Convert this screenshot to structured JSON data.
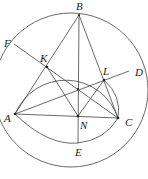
{
  "diagram": {
    "type": "geometry",
    "points": {
      "A": {
        "label": "A",
        "x": 15,
        "y": 114
      },
      "B": {
        "label": "B",
        "x": 79,
        "y": 15
      },
      "C": {
        "label": "C",
        "x": 118,
        "y": 118
      },
      "K": {
        "label": "K",
        "x": 47,
        "y": 67
      },
      "L": {
        "label": "L",
        "x": 104,
        "y": 80
      },
      "N": {
        "label": "N",
        "x": 78,
        "y": 116
      },
      "F": {
        "label": "F",
        "x": 14,
        "y": 44
      },
      "D": {
        "label": "D",
        "x": 129,
        "y": 71
      },
      "E": {
        "label": "E",
        "x": 78,
        "y": 143
      }
    },
    "labels": [
      "B",
      "F",
      "K",
      "L",
      "D",
      "A",
      "N",
      "C",
      "E"
    ],
    "circles": [
      "circumcircle of ABC",
      "circle through A, K, L, C"
    ],
    "arcs": [
      "arc AEC below AC"
    ]
  }
}
